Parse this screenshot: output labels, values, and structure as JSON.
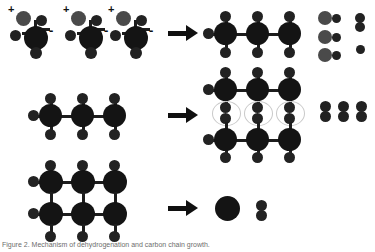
{
  "figure": {
    "caption": "Figure 2. Mechanism of dehydrogenation and carbon chain growth.",
    "reaction_arrow_glyph": "→",
    "colors": {
      "carbon": "#141414",
      "hydrogen": "#222222",
      "gray_sphere": "#4a4a4a",
      "bond": "#1d1d1d",
      "interaction_ring": "#c9c9c9",
      "background": "#ffffff",
      "caption_text": "#6d6d6d"
    },
    "rows": [
      {
        "id": "row-1",
        "reactants_label": "three charged CH3OH-type monomers",
        "monomer_count": 3,
        "charges": [
          "+",
          "-"
        ],
        "products_label": "three-carbon chain plus three OH groups plus hydrogen",
        "product_chain_carbons": 3,
        "product_oh_pairs": 3,
        "product_h2_pairs": 1,
        "product_single_h": 1
      },
      {
        "id": "row-2",
        "reactants_label": "single three-carbon saturated chain",
        "chain_carbons": 3,
        "products_label": "two stacked chains with interacting hydrogen pairs plus three H2 molecules",
        "product_chains": 2,
        "product_interaction_rings": 3,
        "product_h2_pairs": 3
      },
      {
        "id": "row-3",
        "reactants_label": "fused two-layer carbon sheet fragment",
        "sheet_rows": 2,
        "sheet_columns": 3,
        "products_label": "single carbon particle plus one H2 molecule",
        "product_large_sphere": 1,
        "product_h2_pairs": 1
      }
    ],
    "charge_labels": {
      "positive": "+",
      "negative": "-"
    }
  }
}
